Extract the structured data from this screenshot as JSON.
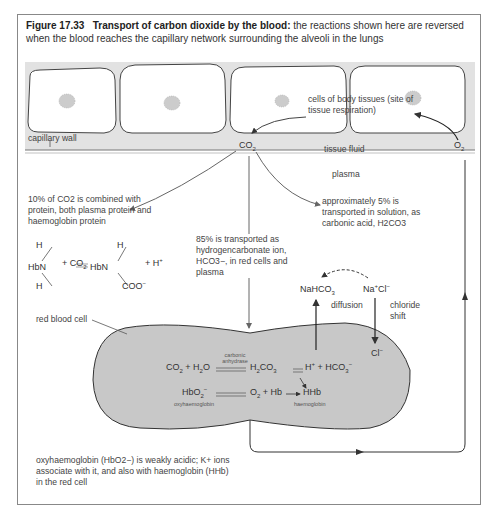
{
  "caption": {
    "figure_number": "Figure 17.33",
    "title": "Transport of carbon dioxide by the blood:",
    "text": "the reactions shown here are reversed when the blood reaches the capillary network surrounding the alveoli in the lungs"
  },
  "regions": {
    "capillary_wall": "capillary wall",
    "tissue_fluid": "tissue fluid",
    "plasma": "plasma",
    "red_blood_cell": "red blood cell",
    "body_cells": "cells of body tissues (site of tissue respiration)"
  },
  "species": {
    "co2": "CO2",
    "o2": "O2",
    "nahco3": "NaHCO3",
    "nacl": "Na+Cl−",
    "cl": "Cl−"
  },
  "pathways": {
    "protein": "10% of CO2 is combined with protein, both plasma protein and haemoglobin protein",
    "solution": "approximately 5% is transported in solution, as carbonic acid, H2CO3",
    "hydrogencarbonate": "85% is transported as hydrogencarbonate ion, HCO3−, in red cells and plasma"
  },
  "labels": {
    "diffusion": "diffusion",
    "chloride_shift": "chloride shift",
    "carbonic_anhydrase": "carbonic anhydrase",
    "oxyhaemoglobin": "oxyhaemoglobin",
    "haemoglobin": "haemoglobin"
  },
  "equations": {
    "carbamino": "HbNH2 + CO2 ⇌ HbNHCOO− + H+",
    "carbonic": "CO2 + H2O ⇌ H2CO3 ⇌ H+ + HCO3−",
    "oxyhb": "HbO2− ⇌ O2 + Hb → HHb"
  },
  "footnote": "oxyhaemoglobin (HbO2−) is weakly acidic; K+ ions associate with it, and also with haemoglobin (HHb) in the red cell"
}
